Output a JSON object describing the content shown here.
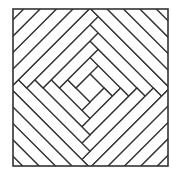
{
  "figure": {
    "square": {
      "x": 13,
      "y": 9,
      "width": 155,
      "height": 157
    },
    "center": {
      "x": 90,
      "y": 88
    },
    "center_half_side": 10,
    "strip_width": 11.6,
    "ring_count": 10,
    "stroke_color": "#333333",
    "background_color": "#ffffff",
    "stroke_width": 1.3,
    "border_width": 1.6
  }
}
